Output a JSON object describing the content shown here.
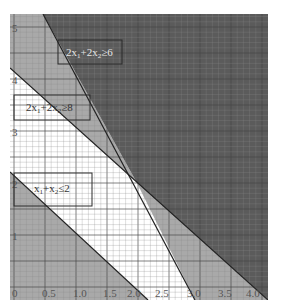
{
  "chart_data": {
    "type": "area",
    "title": "",
    "xlabel": "",
    "ylabel": "",
    "xlim": [
      0,
      4.0
    ],
    "ylim": [
      0,
      5.2
    ],
    "grid": true,
    "x_ticks": [
      "0",
      "0.5",
      "1.0",
      "1.5",
      "2.0",
      "2.5",
      "3.0",
      "3.5",
      "4.0"
    ],
    "y_ticks": [
      "1",
      "2",
      "3",
      "4",
      "5"
    ],
    "constraints": [
      {
        "label": "2x₁+2x₂≥6",
        "line": {
          "from": [
            0.5,
            5.2
          ],
          "to": [
            3.0,
            0
          ]
        },
        "shade": "dark"
      },
      {
        "label": "2x₁+2x₂≥8",
        "line": {
          "from": [
            0,
            4.2
          ],
          "to": [
            4.0,
            0
          ]
        },
        "shade": "dark"
      },
      {
        "label": "x₁+x₂≤2",
        "line": {
          "from": [
            0,
            2.2
          ],
          "to": [
            2.0,
            0
          ]
        },
        "shade": "medium"
      }
    ],
    "colors": {
      "dark": "#5b5b5b",
      "medium": "#a9a9a9",
      "white": "#ffffff",
      "grid_minor": "#8a8a8a",
      "grid_major": "#444444",
      "label_light": "#e6e6e6",
      "label_dark": "#333333"
    }
  },
  "labels": {
    "box1": {
      "main": "2x",
      "s1": "1",
      "mid": "+2x",
      "s2": "2",
      "rel": "≥6"
    },
    "box2": {
      "main": "2x",
      "s1": "1",
      "mid": "+2x",
      "s2": "2",
      "rel": "≥8"
    },
    "box3": {
      "main": "x",
      "s1": "1",
      "mid": "+x",
      "s2": "2",
      "rel": "≤2"
    }
  },
  "ticks": {
    "x": [
      "0",
      "0.5",
      "1.0",
      "1.5",
      "2.0",
      "2.5",
      "3.0",
      "3.5",
      "4.0"
    ],
    "y": [
      "1",
      "2",
      "3",
      "4",
      "5"
    ]
  }
}
